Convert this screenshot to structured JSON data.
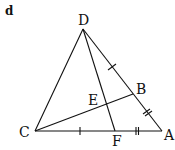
{
  "panel_label": "d",
  "points": {
    "D": {
      "label": "D",
      "x": 83,
      "y": 29
    },
    "C": {
      "label": "C",
      "x": 35,
      "y": 131
    },
    "A": {
      "label": "A",
      "x": 162,
      "y": 131
    },
    "B": {
      "label": "B",
      "x": 133,
      "y": 94
    },
    "F": {
      "label": "F",
      "x": 115,
      "y": 131
    },
    "E": {
      "label": "E",
      "x": 106,
      "y": 103
    }
  },
  "segments": [
    "DC",
    "DA",
    "CA",
    "DF",
    "CB"
  ],
  "tick_marks": [
    {
      "segment": "DB",
      "count": 1
    },
    {
      "segment": "BA",
      "count": 2
    },
    {
      "segment": "CF",
      "count": 1
    },
    {
      "segment": "FA",
      "count": 2
    }
  ],
  "colors": {
    "stroke": "#111111",
    "background": "#ffffff"
  }
}
